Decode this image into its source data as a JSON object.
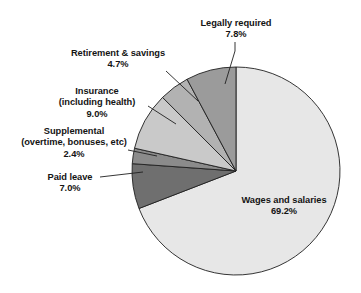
{
  "chart_data": {
    "type": "pie",
    "title": "",
    "subtitle": "",
    "xlabel": "",
    "ylabel": "",
    "legend_position": "none",
    "grid": false,
    "labels_outside_with_leader_lines": true,
    "start_angle_deg": 0,
    "direction": "clockwise",
    "categories": [
      "Wages and salaries",
      "Paid leave",
      "Supplemental (overtime, bonuses, etc)",
      "Insurance (including health)",
      "Retirement & savings",
      "Legally required"
    ],
    "values": [
      69.2,
      7.0,
      2.4,
      9.0,
      4.7,
      7.8
    ],
    "value_labels": [
      "69.2%",
      "7.0%",
      "2.4%",
      "9.0%",
      "4.7%",
      "7.8%"
    ],
    "slices": [
      {
        "name": "Wages and salaries",
        "label_lines": [
          "Wages and salaries"
        ],
        "value": 69.2,
        "value_label": "69.2%",
        "color": "#e7e7e7",
        "label_placement": "inside"
      },
      {
        "name": "Paid leave",
        "label_lines": [
          "Paid leave"
        ],
        "value": 7.0,
        "value_label": "7.0%",
        "color": "#6f6f6f",
        "label_placement": "outside-left"
      },
      {
        "name": "Supplemental",
        "label_lines": [
          "Supplemental",
          "(overtime, bonuses, etc)"
        ],
        "value": 2.4,
        "value_label": "2.4%",
        "color": "#8b8b8b",
        "label_placement": "outside-left"
      },
      {
        "name": "Insurance",
        "label_lines": [
          "Insurance",
          "(including health)"
        ],
        "value": 9.0,
        "value_label": "9.0%",
        "color": "#c9c9c9",
        "label_placement": "outside-left"
      },
      {
        "name": "Retirement & savings",
        "label_lines": [
          "Retirement & savings"
        ],
        "value": 4.7,
        "value_label": "4.7%",
        "color": "#b2b2b2",
        "label_placement": "outside-upper-left"
      },
      {
        "name": "Legally required",
        "label_lines": [
          "Legally required"
        ],
        "value": 7.8,
        "value_label": "7.8%",
        "color": "#9b9b9b",
        "label_placement": "outside-top"
      }
    ]
  },
  "labels": {
    "legally_required": {
      "line1": "Legally required",
      "value": "7.8%"
    },
    "retirement": {
      "line1": "Retirement & savings",
      "value": "4.7%"
    },
    "insurance": {
      "line1": "Insurance",
      "line2": "(including health)",
      "value": "9.0%"
    },
    "supplemental": {
      "line1": "Supplemental",
      "line2": "(overtime, bonuses, etc)",
      "value": "2.4%"
    },
    "paid_leave": {
      "line1": "Paid leave",
      "value": "7.0%"
    },
    "wages": {
      "line1": "Wages and salaries",
      "value": "69.2%"
    }
  },
  "colors": {
    "wages": "#e7e7e7",
    "paid_leave": "#6f6f6f",
    "supplemental": "#8b8b8b",
    "insurance": "#c9c9c9",
    "retirement": "#b2b2b2",
    "legally_required": "#9b9b9b",
    "outline": "#1f1f1f",
    "text": "#141414",
    "background": "#ffffff"
  }
}
